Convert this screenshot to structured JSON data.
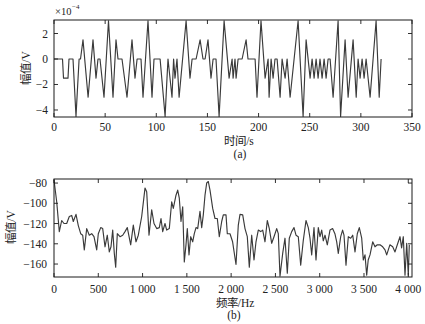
{
  "chart_data": [
    {
      "type": "line",
      "title": "(a)",
      "xlabel": "时间/s",
      "ylabel": "幅值/V",
      "y_scale_base": "×10",
      "y_scale_exponent": "−4",
      "xlim": [
        0,
        350
      ],
      "ylim": [
        -4.55,
        3.06
      ],
      "grid": false,
      "legend": null,
      "xticks": [
        0,
        50,
        100,
        150,
        200,
        250,
        300,
        350
      ],
      "xtick_labels": [
        "0",
        "50",
        "100",
        "150",
        "200",
        "250",
        "300",
        "350"
      ],
      "yticks": [
        2,
        0,
        -2,
        -4
      ],
      "ytick_labels": [
        "2",
        "0",
        "−2",
        "−4"
      ],
      "series": [
        {
          "name": "time-domain signal (×10^-4 V)",
          "x": [
            0,
            8.3,
            9.3,
            13.7,
            14.7,
            18.6,
            21.5,
            24.5,
            25.9,
            28.4,
            33.3,
            38.1,
            41.1,
            43.0,
            45.0,
            48.9,
            53.3,
            57.7,
            60.6,
            62.6,
            66.5,
            71.4,
            76.3,
            79.2,
            81.2,
            85.1,
            87.0,
            91.9,
            95.8,
            97.8,
            103.7,
            108.6,
            110.5,
            111.5,
            115.4,
            116.9,
            118.3,
            120.3,
            122.3,
            129.1,
            133.0,
            135.0,
            138.9,
            142.8,
            145.7,
            147.7,
            150.6,
            153.5,
            155.5,
            158.4,
            161.4,
            166.3,
            171.2,
            174.1,
            175.1,
            177.0,
            178.0,
            180.0,
            183.9,
            187.8,
            189.7,
            196.6,
            198.5,
            202.4,
            206.4,
            209.3,
            210.3,
            212.2,
            214.2,
            216.1,
            218.1,
            221.0,
            223.0,
            225.9,
            227.9,
            230.8,
            238.6,
            243.5,
            246.5,
            250.4,
            252.3,
            254.3,
            256.2,
            258.2,
            260.1,
            262.1,
            264.1,
            266.0,
            268.0,
            269.9,
            272.9,
            277.8,
            280.2,
            284.6,
            287.5,
            292.4,
            295.4,
            297.3,
            299.3,
            301.2,
            303.2,
            305.1,
            309.0,
            314.9,
            317.9,
            319.8
          ],
          "y": [
            0,
            0,
            -1.5,
            -1.5,
            0,
            0,
            -4.5,
            0,
            0,
            1.5,
            -3,
            1.5,
            -1.5,
            0,
            0,
            -3,
            3,
            -3,
            1.5,
            0,
            0,
            -3,
            1.5,
            -1.5,
            0,
            0,
            -3,
            3,
            -3,
            0,
            0,
            -4.5,
            -1.5,
            0,
            -3,
            0,
            -1.5,
            0,
            -3,
            3,
            -1.5,
            0,
            0,
            1.5,
            0,
            0,
            1.5,
            -1.5,
            0,
            0,
            -4.5,
            3,
            -1.5,
            0,
            -1.5,
            0,
            -1.5,
            0,
            0,
            1.5,
            0,
            0,
            -3,
            3,
            -1.5,
            0,
            -3,
            0,
            -1.5,
            0,
            0,
            -3,
            0,
            -1.5,
            0,
            -3,
            3,
            -4.5,
            1.5,
            -1.5,
            0,
            -1.5,
            0,
            -1.5,
            0,
            -1.5,
            0,
            -1.5,
            0,
            0,
            -3,
            3,
            -4.5,
            1.5,
            -3,
            1.5,
            -3,
            0,
            -1.5,
            0,
            -1.5,
            0,
            -3,
            3,
            -3,
            0
          ]
        }
      ]
    },
    {
      "type": "line",
      "title": "(b)",
      "xlabel": "频率/Hz",
      "ylabel": "幅值/V",
      "xlim": [
        0,
        4042
      ],
      "ylim": [
        -172.8,
        -76
      ],
      "grid": false,
      "legend": null,
      "xticks": [
        0,
        500,
        1000,
        1500,
        2000,
        2500,
        3000,
        3500,
        4000
      ],
      "xtick_labels": [
        "0",
        "500",
        "1 000",
        "1 500",
        "2 000",
        "2 500",
        "3 000",
        "3 500",
        "4 000"
      ],
      "yticks": [
        -80,
        -100,
        -120,
        -140,
        -160
      ],
      "ytick_labels": [
        "−80",
        "−100",
        "−120",
        "−140",
        "−160"
      ],
      "series": [
        {
          "name": "spectrum",
          "x": [
            0,
            30,
            60,
            87,
            113,
            143,
            173,
            200,
            218,
            248,
            274,
            301,
            324,
            342,
            369,
            399,
            426,
            452,
            482,
            500,
            527,
            550,
            576,
            602,
            624,
            644,
            663,
            681,
            697,
            715,
            745,
            776,
            802,
            828,
            866,
            895,
            926,
            952,
            990,
            1027,
            1047,
            1073,
            1103,
            1129,
            1159,
            1189,
            1208,
            1227,
            1253,
            1272,
            1302,
            1329,
            1347,
            1377,
            1397,
            1415,
            1434,
            1453,
            1471,
            1490,
            1505,
            1524,
            1543,
            1566,
            1584,
            1603,
            1622,
            1648,
            1668,
            1686,
            1705,
            1724,
            1742,
            1761,
            1792,
            1818,
            1844,
            1866,
            1893,
            1911,
            1942,
            1957,
            1987,
            2017,
            2055,
            2081,
            2100,
            2130,
            2156,
            2182,
            2205,
            2232,
            2258,
            2281,
            2307,
            2334,
            2356,
            2382,
            2408,
            2431,
            2458,
            2484,
            2514,
            2532,
            2552,
            2582,
            2608,
            2634,
            2657,
            2684,
            2710,
            2732,
            2758,
            2785,
            2815,
            2845,
            2871,
            2890,
            2909,
            2935,
            2958,
            2984,
            3003,
            3022,
            3040,
            3060,
            3086,
            3116,
            3146,
            3172,
            3192,
            3210,
            3237,
            3259,
            3274,
            3297,
            3323,
            3350,
            3372,
            3398,
            3424,
            3447,
            3474,
            3492,
            3511,
            3530,
            3548,
            3568,
            3598,
            3624,
            3650,
            3681,
            3711,
            3737,
            3756,
            3774,
            3793,
            3824,
            3850,
            3876,
            3906,
            3925,
            3944,
            3963,
            3982,
            4000,
            4012
          ],
          "y": [
            -77,
            -98.5,
            -128,
            -117,
            -120,
            -120,
            -113,
            -112,
            -118,
            -111,
            -122,
            -130,
            -131.5,
            -146,
            -125,
            -131.5,
            -130,
            -133,
            -146,
            -130,
            -124,
            -125,
            -143,
            -131.5,
            -148,
            -143,
            -126.5,
            -149.5,
            -163,
            -130,
            -133,
            -131.5,
            -128,
            -124,
            -141,
            -121.5,
            -138,
            -131.5,
            -113,
            -85,
            -88.5,
            -131.5,
            -106.5,
            -120,
            -125,
            -124,
            -115,
            -128,
            -120,
            -126.5,
            -125,
            -98.5,
            -105,
            -92,
            -87,
            -95,
            -118,
            -103.5,
            -158,
            -141,
            -125,
            -151,
            -133,
            -138,
            -130,
            -124,
            -125,
            -108,
            -124,
            -111.5,
            -92,
            -80,
            -78.5,
            -87,
            -105,
            -115,
            -115,
            -133,
            -118,
            -111.5,
            -111.5,
            -130,
            -130,
            -138,
            -160.5,
            -121.5,
            -111,
            -111.5,
            -125,
            -133,
            -163,
            -131.5,
            -156,
            -138,
            -126.5,
            -128,
            -126.5,
            -138,
            -117,
            -125,
            -139.5,
            -133,
            -125,
            -130,
            -172,
            -149.5,
            -134.5,
            -169,
            -134.5,
            -128,
            -124,
            -131.5,
            -133,
            -161,
            -136.5,
            -117,
            -124,
            -134.5,
            -151,
            -124,
            -156,
            -124,
            -133,
            -126.5,
            -137,
            -131.5,
            -141,
            -126.5,
            -125,
            -130,
            -138,
            -149.5,
            -133,
            -126.5,
            -131.5,
            -161,
            -133,
            -134.5,
            -131.5,
            -148,
            -130,
            -124,
            -134.5,
            -156,
            -151,
            -171,
            -156,
            -151,
            -138,
            -143,
            -141,
            -141,
            -143,
            -146,
            -151,
            -146,
            -141,
            -143,
            -148,
            -141,
            -133,
            -144,
            -133,
            -171,
            -139.5,
            -171,
            -141
          ]
        }
      ]
    }
  ]
}
